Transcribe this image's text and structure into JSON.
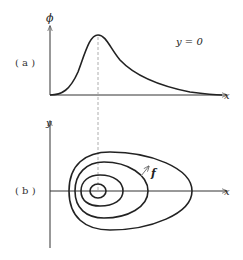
{
  "panel_a": {
    "label": "( a )",
    "y_axis_label": "ϕ",
    "x_axis_label": "x",
    "annotation": "y = 0"
  },
  "panel_b": {
    "label": "( b )",
    "y_axis_label": "y",
    "x_axis_label": "x",
    "vector_label": "f"
  },
  "colors": {
    "stroke": "#222222",
    "dashed": "#999999",
    "background": "#ffffff"
  }
}
